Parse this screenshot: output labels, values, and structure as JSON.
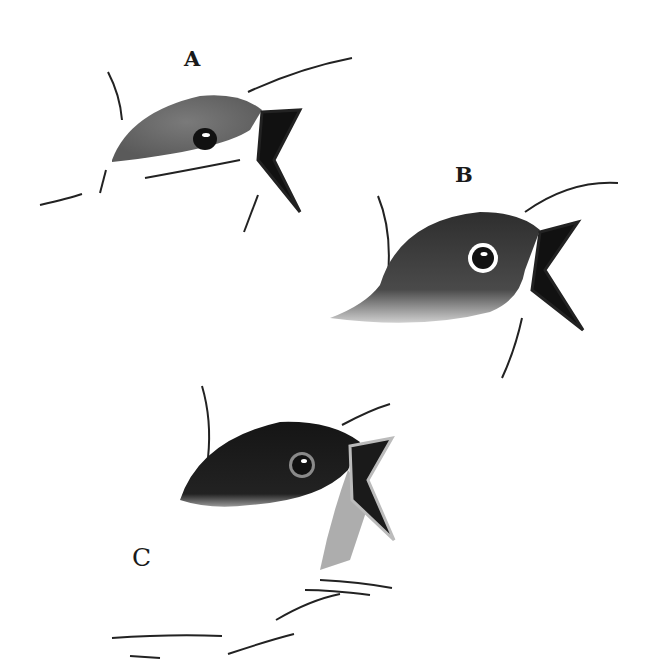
{
  "figure": {
    "labels": {
      "a": "A",
      "b": "B",
      "c": "C"
    },
    "subjects": [
      {
        "id": "A",
        "description": "nestling bird head, pale grey crown, open beak"
      },
      {
        "id": "B",
        "description": "nestling bird head, medium-dark grey head, white eye-ring, open beak"
      },
      {
        "id": "C",
        "description": "nestling bird head, dark black crown, open beak"
      }
    ],
    "colors": {
      "background": "#ffffff",
      "ink": "#1a1a1a",
      "crown_a": "#6e6e6e",
      "crown_b": "#3a3a3a",
      "crown_c": "#1c1c1c"
    }
  }
}
